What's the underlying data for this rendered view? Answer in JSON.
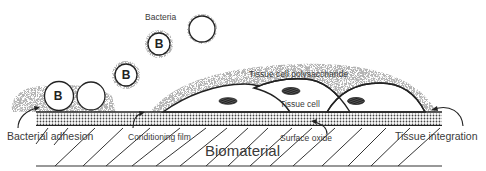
{
  "diagram": {
    "labels": {
      "bacteria": "Bacteria",
      "tissue_cell_polysaccharide": "Tissue cell polysaccharide",
      "tissue_cell": "Tissue cell",
      "bacterial_adhesion": "Bacterial adhesion",
      "conditioning_film": "Conditioning film",
      "surface_oxide": "Surface oxide",
      "tissue_integration": "Tissue integration",
      "biomaterial": "Biomaterial"
    },
    "bacteria_marker": "B",
    "layers": [
      "Tissue cell polysaccharide",
      "Conditioning film",
      "Surface oxide",
      "Biomaterial"
    ],
    "colors": {
      "line": "#222222",
      "stipple": "#9a9a9a",
      "text": "#3a3a3a",
      "background": "#ffffff"
    }
  }
}
